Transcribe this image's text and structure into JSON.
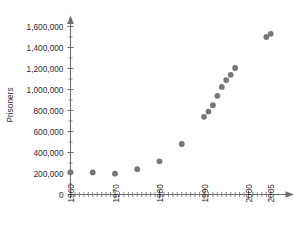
{
  "chart_data": {
    "type": "scatter",
    "title": "",
    "xlabel": "",
    "ylabel": "Prisoners",
    "xlim": [
      1960,
      2006
    ],
    "ylim": [
      0,
      1700000
    ],
    "grid": false,
    "legend": null,
    "x_tick_labels": [
      "1960",
      "1970",
      "1980",
      "1990",
      "2000",
      "2005"
    ],
    "x_tick_values": [
      1960,
      1970,
      1980,
      1990,
      2000,
      2005
    ],
    "y_tick_labels": [
      "0",
      "200,000",
      "400,000",
      "600,000",
      "800,000",
      "1,000,000",
      "1,200,000",
      "1,400,000",
      "1,600,000"
    ],
    "y_tick_values": [
      0,
      200000,
      400000,
      600000,
      800000,
      1000000,
      1200000,
      1400000,
      1600000
    ],
    "x": [
      1960,
      1965,
      1970,
      1975,
      1980,
      1985,
      1990,
      1991,
      1992,
      1993,
      1994,
      1995,
      1996,
      2004,
      2005
    ],
    "values": [
      212000,
      210000,
      198000,
      241000,
      316000,
      481000,
      740000,
      790000,
      850000,
      940000,
      1025000,
      1090000,
      1140000,
      1205000,
      1500000
    ],
    "points": [
      {
        "x": 1960,
        "y": 212000
      },
      {
        "x": 1965,
        "y": 210000
      },
      {
        "x": 1970,
        "y": 198000
      },
      {
        "x": 1975,
        "y": 241000
      },
      {
        "x": 1980,
        "y": 316000
      },
      {
        "x": 1985,
        "y": 481000
      },
      {
        "x": 1990,
        "y": 740000
      },
      {
        "x": 1991,
        "y": 790000
      },
      {
        "x": 1992,
        "y": 850000
      },
      {
        "x": 1993,
        "y": 940000
      },
      {
        "x": 1994,
        "y": 1025000
      },
      {
        "x": 1995,
        "y": 1090000
      },
      {
        "x": 1996,
        "y": 1140000
      },
      {
        "x": 1997,
        "y": 1205000
      },
      {
        "x": 2004,
        "y": 1500000
      },
      {
        "x": 2005,
        "y": 1530000
      }
    ],
    "marker_color": "#777777",
    "axis_color": "#6d6d6d"
  },
  "axes": {
    "y_axis_title": "Prisoners",
    "x_axis_title": ""
  }
}
